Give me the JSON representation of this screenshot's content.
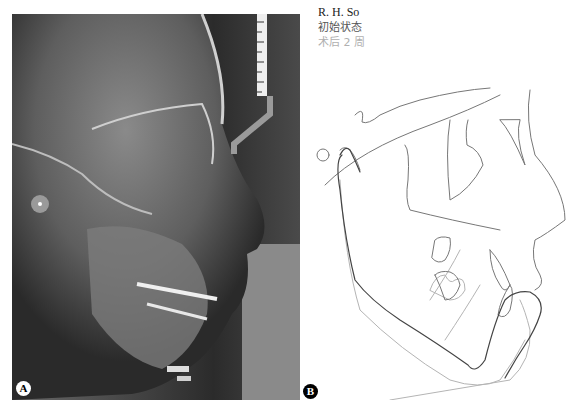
{
  "panel_a": {
    "label": "A",
    "description": "lateral cephalometric radiograph"
  },
  "panel_b": {
    "label": "B",
    "legend": {
      "patient": "R. H. So",
      "series": [
        {
          "label": "初始状态",
          "color": "#555555"
        },
        {
          "label": "术后 2 周",
          "color": "#b0b0b0"
        }
      ]
    }
  }
}
